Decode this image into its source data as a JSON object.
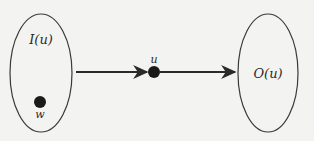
{
  "diagram": {
    "background": "#f3f3f1",
    "stroke_color": "#3a3a3a",
    "sets": [
      {
        "id": "in-set",
        "label": "I(u)",
        "cx": 41,
        "cy": 73,
        "rx": 31,
        "ry": 59,
        "label_x": 41,
        "label_y": 44
      },
      {
        "id": "out-set",
        "label": "O(u)",
        "cx": 268,
        "cy": 73,
        "rx": 30,
        "ry": 59,
        "label_x": 268,
        "label_y": 78
      }
    ],
    "nodes": [
      {
        "id": "u",
        "label": "u",
        "cx": 154,
        "cy": 72,
        "r": 6,
        "label_x": 154,
        "label_y": 63
      },
      {
        "id": "w",
        "label": "w",
        "cx": 40,
        "cy": 102,
        "r": 6,
        "label_x": 40,
        "label_y": 118
      }
    ],
    "edges": [
      {
        "from": "I(u)",
        "to": "u",
        "x1": 76,
        "y1": 72,
        "x2": 147,
        "y2": 72
      },
      {
        "from": "u",
        "to": "O(u)",
        "x1": 160,
        "y1": 72,
        "x2": 235,
        "y2": 72
      }
    ]
  }
}
